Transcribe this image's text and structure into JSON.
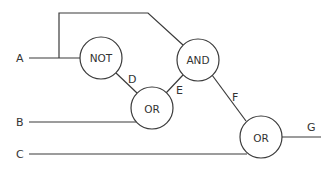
{
  "diagram": {
    "type": "logic-circuit",
    "inputs": [
      {
        "id": "A",
        "label": "A"
      },
      {
        "id": "B",
        "label": "B"
      },
      {
        "id": "C",
        "label": "C"
      }
    ],
    "output": {
      "id": "G",
      "label": "G"
    },
    "gates": [
      {
        "id": "not1",
        "label": "NOT"
      },
      {
        "id": "and1",
        "label": "AND"
      },
      {
        "id": "or1",
        "label": "OR"
      },
      {
        "id": "or2",
        "label": "OR"
      }
    ],
    "wire_labels": {
      "D": "D",
      "E": "E",
      "F": "F"
    },
    "connections": [
      {
        "from": "A",
        "to": "not1"
      },
      {
        "from": "A",
        "to": "and1"
      },
      {
        "from": "not1",
        "to": "or1",
        "label": "D"
      },
      {
        "from": "B",
        "to": "or1"
      },
      {
        "from": "or1",
        "to": "and1",
        "label": "E"
      },
      {
        "from": "and1",
        "to": "or2",
        "label": "F"
      },
      {
        "from": "C",
        "to": "or2"
      },
      {
        "from": "or2",
        "to": "G"
      }
    ]
  }
}
